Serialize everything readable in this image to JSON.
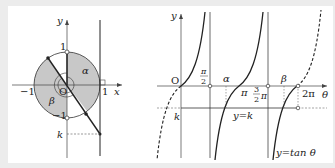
{
  "diagram": {
    "left_panel": {
      "title": "unit circle",
      "axis_labels": {
        "x": "x",
        "y": "y"
      },
      "origin_label": "O",
      "tick_labels": {
        "x_pos": "1",
        "x_neg": "−1",
        "y_pos": "1",
        "y_neg": "−1"
      },
      "angle_labels": {
        "alpha": "α",
        "beta": "β"
      },
      "k_label": "k",
      "colors": {
        "shade": "#c8c8c8",
        "line": "#222222"
      }
    },
    "right_panel": {
      "title": "graph of y = tan θ",
      "axis_labels": {
        "x": "θ",
        "y": "y"
      },
      "origin_label": "O",
      "tick_labels": {
        "half_pi_num": "π",
        "half_pi_den": "2",
        "pi": "π",
        "three_half_num": "3",
        "three_half_den": "2",
        "three_half_pi": "π",
        "two_pi": "2π"
      },
      "point_labels": {
        "alpha": "α",
        "beta": "β"
      },
      "k_label": "k",
      "line_label": "y=k",
      "curve_label": "y=tan θ"
    }
  }
}
